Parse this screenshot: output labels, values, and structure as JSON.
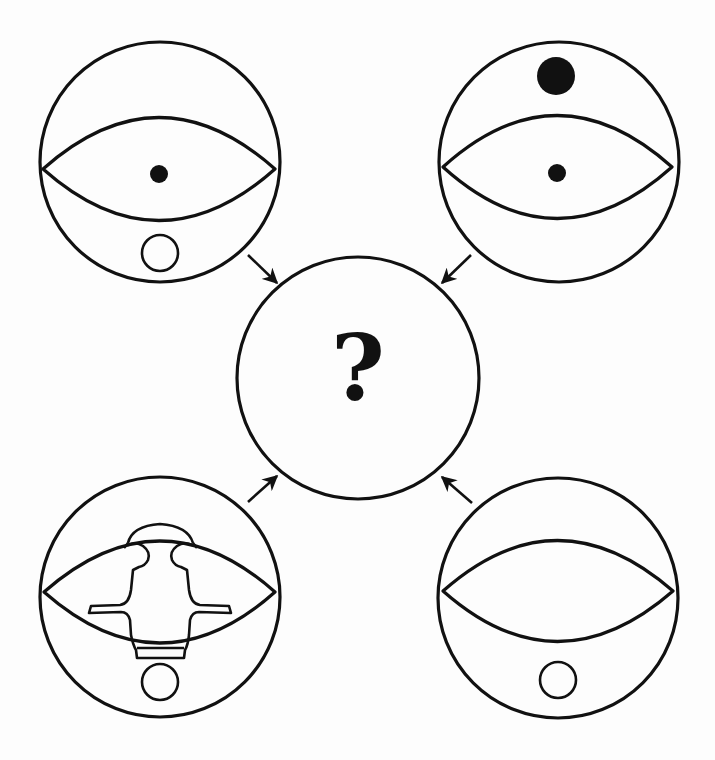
{
  "diagram": {
    "type": "visual-reasoning-puzzle",
    "center": {
      "label": "?",
      "meaning": "unknown-result"
    },
    "inputs": [
      {
        "position": "top-left",
        "elements": [
          "outer-circle",
          "eye-shape",
          "small-filled-dot-center",
          "small-hollow-circle-bottom"
        ]
      },
      {
        "position": "top-right",
        "elements": [
          "outer-circle",
          "eye-shape",
          "small-filled-dot-center",
          "large-filled-dot-top"
        ]
      },
      {
        "position": "bottom-left",
        "elements": [
          "outer-circle",
          "eye-shape",
          "symmetric-figure-overlay",
          "small-hollow-circle-bottom"
        ]
      },
      {
        "position": "bottom-right",
        "elements": [
          "outer-circle",
          "eye-shape",
          "small-hollow-circle-bottom"
        ]
      }
    ],
    "arrows": [
      {
        "from": "top-left",
        "to": "center"
      },
      {
        "from": "top-right",
        "to": "center"
      },
      {
        "from": "bottom-left",
        "to": "center"
      },
      {
        "from": "bottom-right",
        "to": "center"
      }
    ],
    "colors": {
      "stroke": "#111111",
      "background": "#fdfdfd"
    }
  }
}
